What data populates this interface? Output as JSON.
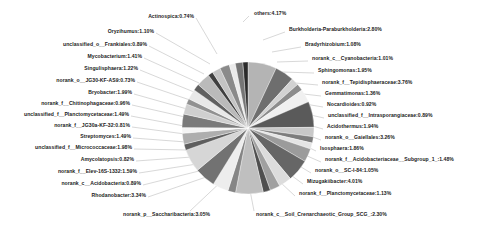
{
  "chart_data": {
    "type": "pie",
    "title": "",
    "legend_position": "none",
    "label_format": "name:percent",
    "slices": [
      {
        "label": "others",
        "value": 4.17,
        "text": "others:4.17%",
        "color": "#b4b4b4",
        "side": "right"
      },
      {
        "label": "Burkholderia-Paraburkholderia",
        "value": 2.8,
        "text": "Burkholderia-Paraburkholderia:2.80%",
        "color": "#6e6e6e",
        "side": "right"
      },
      {
        "label": "Bradyrhizobium",
        "value": 1.08,
        "text": "Bradyrhizobium:1.08%",
        "color": "#d2d2d2",
        "side": "right"
      },
      {
        "label": "norank_c__Cyanobacteria",
        "value": 1.01,
        "text": "norank_c__Cyanobacteria:1.01%",
        "color": "#8c8c8c",
        "side": "right"
      },
      {
        "label": "Sphingomonas",
        "value": 1.95,
        "text": "Sphingomonas:1.95%",
        "color": "#f0f0f0",
        "side": "right"
      },
      {
        "label": "norank_f__Tepidisphaeraceae",
        "value": 3.76,
        "text": "norank_f__Tepidisphaeraceae:3.76%",
        "color": "#5a5a5a",
        "side": "right"
      },
      {
        "label": "Gemmatimonas",
        "value": 1.36,
        "text": "Gemmatimonas:1.36%",
        "color": "#c8c8c8",
        "side": "right"
      },
      {
        "label": "Nocardioides",
        "value": 0.92,
        "text": "Nocardioides:0.92%",
        "color": "#7d7d7d",
        "side": "right"
      },
      {
        "label": "unclassified_f__Intrasporangiaceae",
        "value": 0.89,
        "text": "unclassified_f__Intrasporangiaceae:0.89%",
        "color": "#e4e4e4",
        "side": "right"
      },
      {
        "label": "Acidothermus",
        "value": 1.94,
        "text": "Acidothermus:1.94%",
        "color": "#9b9b9b",
        "side": "right"
      },
      {
        "label": "norank_o__Gaiellales",
        "value": 3.26,
        "text": "norank_o__Gaiellales:3.26%",
        "color": "#666666",
        "side": "right"
      },
      {
        "label": "Isosphaera",
        "value": 1.86,
        "text": "Isosphaera:1.86%",
        "color": "#dcdcdc",
        "side": "right"
      },
      {
        "label": "norank_f__Acidobacteriaceae__Subgroup_1_",
        "value": 1.48,
        "text": "norank_f__Acidobacteriaceae__Subgroup_1_:1.48%",
        "color": "#a0a0a0",
        "side": "right"
      },
      {
        "label": "norank_o__SC-I-84",
        "value": 1.05,
        "text": "norank_o__SC-I-84:1.05%",
        "color": "#4f4f4f",
        "side": "right"
      },
      {
        "label": "Mizugakiibacter",
        "value": 4.01,
        "text": "Mizugakiibacter:4.01%",
        "color": "#bfbfbf",
        "side": "right"
      },
      {
        "label": "norank_f__Planctomycetaceae",
        "value": 1.13,
        "text": "norank_f__Planctomycetaceae:1.13%",
        "color": "#858585",
        "side": "right"
      },
      {
        "label": "norank_c__Soil_Crenarchaeotic_Group_SCG_",
        "value": 2.3,
        "text": "norank_c__Soil_Crenarchaeotic_Group_SCG_:2.30%",
        "color": "#ededed",
        "side": "bottom"
      },
      {
        "label": "norank_p__Saccharibacteria",
        "value": 3.05,
        "text": "norank_p__Saccharibacteria:3.05%",
        "color": "#727272",
        "side": "bottom"
      },
      {
        "label": "Rhodanobacter",
        "value": 3.34,
        "text": "Rhodanobacter:3.34%",
        "color": "#d6d6d6",
        "side": "left"
      },
      {
        "label": "norank_c__Acidobacteria",
        "value": 0.89,
        "text": "norank_c__Acidobacteria:0.89%",
        "color": "#5e5e5e",
        "side": "left"
      },
      {
        "label": "norank_f__Elev-16S-1332",
        "value": 1.59,
        "text": "norank_f__Elev-16S-1332:1.59%",
        "color": "#aeaeae",
        "side": "left"
      },
      {
        "label": "Amycolatopsis",
        "value": 0.82,
        "text": "Amycolatopsis:0.82%",
        "color": "#f4f4f4",
        "side": "left"
      },
      {
        "label": "unclassified_f__Micrococcaceae",
        "value": 1.98,
        "text": "unclassified_f__Micrococcaceae:1.98%",
        "color": "#7a7a7a",
        "side": "left"
      },
      {
        "label": "Streptomyces",
        "value": 1.49,
        "text": "Streptomyces:1.49%",
        "color": "#cfcfcf",
        "side": "left"
      },
      {
        "label": "norank_f__JG30a-KF-32",
        "value": 0.81,
        "text": "norank_f__JG30a-KF-32:0.81%",
        "color": "#919191",
        "side": "left"
      },
      {
        "label": "unclassified_f__Planctomycetaceae",
        "value": 1.49,
        "text": "unclassified_f__Planctomycetaceae:1.49%",
        "color": "#e8e8e8",
        "side": "left"
      },
      {
        "label": "norank_f__Chitinophagaceae",
        "value": 0.96,
        "text": "norank_f__Chitinophagaceae:0.96%",
        "color": "#606060",
        "side": "left"
      },
      {
        "label": "Bryobacter",
        "value": 1.99,
        "text": "Bryobacter:1.99%",
        "color": "#bababa",
        "side": "left"
      },
      {
        "label": "norank_o__JG30-KF-AS9",
        "value": 0.73,
        "text": "norank_o__JG30-KF-AS9:0.73%",
        "color": "#3f3f3f",
        "side": "left"
      },
      {
        "label": "Singulisphaera",
        "value": 1.22,
        "text": "Singulisphaera:1.22%",
        "color": "#c4c4c4",
        "side": "left"
      },
      {
        "label": "Mycobacterium",
        "value": 1.41,
        "text": "Mycobacterium:1.41%",
        "color": "#8a8a8a",
        "side": "left"
      },
      {
        "label": "unclassified_o__Frankiales",
        "value": 0.89,
        "text": "unclassified_o__Frankiales:0.89%",
        "color": "#ebebeb",
        "side": "left"
      },
      {
        "label": "Oryzihumus",
        "value": 1.1,
        "text": "Oryzihumus:1.10%",
        "color": "#757575",
        "side": "left"
      },
      {
        "label": "Actinospica",
        "value": 0.74,
        "text": "Actinospica:0.74%",
        "color": "#2b2b2b",
        "side": "left"
      }
    ],
    "label_positions": {
      "right": [
        {
          "key": "others",
          "x": 254,
          "y": 13,
          "lx1": 249,
          "ly1": 16,
          "lx2": 243,
          "ly2": 22
        },
        {
          "key": "burkholderia",
          "x": 289,
          "y": 29,
          "lx1": 285,
          "ly1": 32,
          "lx2": 263,
          "ly2": 40
        },
        {
          "key": "bradyrhizobium",
          "x": 305,
          "y": 44,
          "lx1": 301,
          "ly1": 47,
          "lx2": 272,
          "ly2": 52
        },
        {
          "key": "cyanobacteria",
          "x": 312,
          "y": 58,
          "lx1": 308,
          "ly1": 61,
          "lx2": 277,
          "ly2": 62
        },
        {
          "key": "sphingomonas",
          "x": 318,
          "y": 70,
          "lx1": 314,
          "ly1": 73,
          "lx2": 281,
          "ly2": 72
        },
        {
          "key": "tepidisphaeraceae",
          "x": 322,
          "y": 82,
          "lx1": 318,
          "ly1": 85,
          "lx2": 284,
          "ly2": 82
        },
        {
          "key": "gemmatimonas",
          "x": 325,
          "y": 93,
          "lx1": 321,
          "ly1": 96,
          "lx2": 286,
          "ly2": 92
        },
        {
          "key": "nocardioides",
          "x": 327,
          "y": 104,
          "lx1": 323,
          "ly1": 107,
          "lx2": 287,
          "ly2": 101
        },
        {
          "key": "intrasporangiaceae",
          "x": 328,
          "y": 115,
          "lx1": 324,
          "ly1": 118,
          "lx2": 288,
          "ly2": 110
        },
        {
          "key": "acidothermus",
          "x": 327,
          "y": 126,
          "lx1": 323,
          "ly1": 129,
          "lx2": 288,
          "ly2": 119
        },
        {
          "key": "gaiellales",
          "x": 325,
          "y": 137,
          "lx1": 321,
          "ly1": 140,
          "lx2": 287,
          "ly2": 128
        },
        {
          "key": "isosphaera",
          "x": 320,
          "y": 148,
          "lx1": 316,
          "ly1": 151,
          "lx2": 285,
          "ly2": 136
        },
        {
          "key": "acidobacteriaceae",
          "x": 325,
          "y": 159,
          "lx1": 321,
          "ly1": 162,
          "lx2": 282,
          "ly2": 145
        },
        {
          "key": "scI84",
          "x": 315,
          "y": 170,
          "lx1": 311,
          "ly1": 173,
          "lx2": 278,
          "ly2": 153
        },
        {
          "key": "mizugakiibacter",
          "x": 307,
          "y": 181,
          "lx1": 303,
          "ly1": 184,
          "lx2": 272,
          "ly2": 161
        },
        {
          "key": "planctomycetaceae_nr",
          "x": 299,
          "y": 193,
          "lx1": 295,
          "ly1": 196,
          "lx2": 265,
          "ly2": 168
        }
      ],
      "bottom": [
        {
          "key": "soilcren",
          "x": 256,
          "y": 214,
          "lx1": 254,
          "ly1": 211,
          "lx2": 248,
          "ly2": 180
        },
        {
          "key": "saccharibacteria",
          "x": 123,
          "y": 214,
          "lx1": 190,
          "ly1": 211,
          "lx2": 225,
          "ly2": 178
        }
      ],
      "left": [
        {
          "key": "rhodanobacter",
          "x": 76,
          "y": 195,
          "lx1": 148,
          "ly1": 197,
          "lx2": 212,
          "ly2": 175
        },
        {
          "key": "acidobacteria_c",
          "x": 56,
          "y": 183,
          "lx1": 143,
          "ly1": 185,
          "lx2": 203,
          "ly2": 170
        },
        {
          "key": "elev16s",
          "x": 60,
          "y": 171,
          "lx1": 139,
          "ly1": 173,
          "lx2": 197,
          "ly2": 164
        },
        {
          "key": "amycolatopsis",
          "x": 85,
          "y": 159,
          "lx1": 136,
          "ly1": 161,
          "lx2": 192,
          "ly2": 157
        },
        {
          "key": "micrococcaceae",
          "x": 41,
          "y": 147,
          "lx1": 134,
          "ly1": 149,
          "lx2": 188,
          "ly2": 150
        },
        {
          "key": "streptomyces",
          "x": 78,
          "y": 136,
          "lx1": 133,
          "ly1": 138,
          "lx2": 186,
          "ly2": 142
        },
        {
          "key": "jg30a",
          "x": 40,
          "y": 125,
          "lx1": 132,
          "ly1": 127,
          "lx2": 185,
          "ly2": 134
        },
        {
          "key": "planctomycetaceae_un",
          "x": 18,
          "y": 114,
          "lx1": 131,
          "ly1": 116,
          "lx2": 184,
          "ly2": 126
        },
        {
          "key": "chitinophagaceae",
          "x": 33,
          "y": 103,
          "lx1": 132,
          "ly1": 105,
          "lx2": 185,
          "ly2": 117
        },
        {
          "key": "bryobacter",
          "x": 70,
          "y": 92,
          "lx1": 134,
          "ly1": 94,
          "lx2": 187,
          "ly2": 109
        },
        {
          "key": "jg30kfas9",
          "x": 41,
          "y": 80,
          "lx1": 137,
          "ly1": 82,
          "lx2": 190,
          "ly2": 100
        },
        {
          "key": "singulisphaera",
          "x": 62,
          "y": 68,
          "lx1": 140,
          "ly1": 70,
          "lx2": 194,
          "ly2": 92
        },
        {
          "key": "mycobacterium",
          "x": 60,
          "y": 56,
          "lx1": 144,
          "ly1": 58,
          "lx2": 199,
          "ly2": 83
        },
        {
          "key": "frankiales",
          "x": 41,
          "y": 44,
          "lx1": 149,
          "ly1": 46,
          "lx2": 204,
          "ly2": 74
        },
        {
          "key": "oryzihumus",
          "x": 73,
          "y": 31,
          "lx1": 156,
          "ly1": 33,
          "lx2": 210,
          "ly2": 64
        },
        {
          "key": "actinospica",
          "x": 135,
          "y": 16,
          "lx1": 196,
          "ly1": 18,
          "lx2": 217,
          "ly2": 54
        }
      ]
    },
    "geometry": {
      "cx": 248,
      "cy": 128,
      "r": 66
    }
  }
}
